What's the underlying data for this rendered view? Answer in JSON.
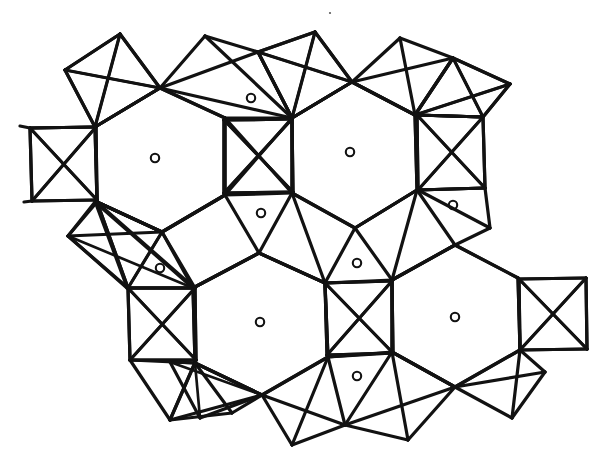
{
  "figure": {
    "background_color": "#ffffff",
    "line_color": "#121212",
    "marker_color": "#121212",
    "line_width": 3.2,
    "marker_radius": 4.2,
    "units": "pixels",
    "width": 608,
    "height": 473
  },
  "legend_items": [
    {
      "symbol": "open-circle",
      "label": "interstitial site",
      "count": 11
    },
    {
      "symbol": "solid-line",
      "label": "polyhedron edge",
      "count": 0
    }
  ],
  "hexagons": [
    {
      "name": "hexagon-upper-left",
      "center": [
        160,
        160
      ],
      "vertices": [
        [
          160,
          88
        ],
        [
          225,
          118
        ],
        [
          225,
          195
        ],
        [
          162,
          232
        ],
        [
          97,
          202
        ],
        [
          95,
          127
        ]
      ]
    },
    {
      "name": "hexagon-upper-right",
      "center": [
        352,
        154
      ],
      "vertices": [
        [
          352,
          82
        ],
        [
          415,
          115
        ],
        [
          417,
          190
        ],
        [
          355,
          228
        ],
        [
          292,
          193
        ],
        [
          292,
          118
        ]
      ]
    },
    {
      "name": "hexagon-lower-left",
      "center": [
        260,
        323
      ],
      "vertices": [
        [
          259,
          253
        ],
        [
          325,
          283
        ],
        [
          328,
          357
        ],
        [
          262,
          395
        ],
        [
          195,
          363
        ],
        [
          193,
          288
        ]
      ]
    },
    {
      "name": "hexagon-lower-right",
      "center": [
        455,
        317
      ],
      "vertices": [
        [
          455,
          245
        ],
        [
          518,
          278
        ],
        [
          520,
          350
        ],
        [
          455,
          387
        ],
        [
          392,
          352
        ],
        [
          392,
          280
        ]
      ]
    }
  ],
  "crossed_squares": [
    {
      "name": "crossed-square-far-left",
      "vertices": [
        [
          30,
          128
        ],
        [
          96,
          127
        ],
        [
          97,
          200
        ],
        [
          32,
          201
        ]
      ]
    },
    {
      "name": "crossed-square-center-top",
      "vertices": [
        [
          224,
          120
        ],
        [
          292,
          119
        ],
        [
          293,
          192
        ],
        [
          224,
          193
        ]
      ]
    },
    {
      "name": "crossed-square-right-top",
      "vertices": [
        [
          417,
          115
        ],
        [
          483,
          117
        ],
        [
          485,
          188
        ],
        [
          418,
          190
        ]
      ]
    },
    {
      "name": "crossed-square-left-bottom",
      "vertices": [
        [
          128,
          288
        ],
        [
          195,
          288
        ],
        [
          196,
          360
        ],
        [
          130,
          360
        ]
      ]
    },
    {
      "name": "crossed-square-center-bottom",
      "vertices": [
        [
          325,
          283
        ],
        [
          392,
          281
        ],
        [
          393,
          353
        ],
        [
          327,
          355
        ]
      ]
    },
    {
      "name": "crossed-square-far-right",
      "vertices": [
        [
          519,
          279
        ],
        [
          586,
          278
        ],
        [
          587,
          349
        ],
        [
          520,
          350
        ]
      ]
    }
  ],
  "crossed_quads_tilted": [
    {
      "name": "tilted-quad-top-left",
      "vertices": [
        [
          65,
          70
        ],
        [
          120,
          34
        ],
        [
          160,
          88
        ],
        [
          95,
          127
        ]
      ]
    },
    {
      "name": "tilted-quad-top-right",
      "vertices": [
        [
          258,
          52
        ],
        [
          315,
          32
        ],
        [
          352,
          82
        ],
        [
          292,
          118
        ]
      ]
    },
    {
      "name": "tilted-quad-upper-far-right",
      "vertices": [
        [
          415,
          115
        ],
        [
          453,
          58
        ],
        [
          510,
          84
        ],
        [
          483,
          117
        ]
      ]
    },
    {
      "name": "tilted-quad-left-mid",
      "vertices": [
        [
          95,
          202
        ],
        [
          68,
          236
        ],
        [
          127,
          288
        ],
        [
          193,
          288
        ]
      ]
    },
    {
      "name": "tilted-quad-bottom-left",
      "vertices": [
        [
          162,
          232
        ],
        [
          97,
          202
        ],
        [
          128,
          288
        ],
        [
          195,
          288
        ]
      ]
    },
    {
      "name": "tilted-quad-bottom-mid",
      "vertices": [
        [
          262,
          395
        ],
        [
          200,
          418
        ],
        [
          170,
          362
        ],
        [
          195,
          363
        ]
      ]
    }
  ],
  "site_markers": [
    {
      "name": "site-hex-upper-left",
      "position": [
        155,
        158
      ]
    },
    {
      "name": "site-triangle-top",
      "position": [
        251,
        98
      ]
    },
    {
      "name": "site-hex-upper-right",
      "position": [
        350,
        152
      ]
    },
    {
      "name": "site-triangle-right",
      "position": [
        453,
        205
      ]
    },
    {
      "name": "site-triangle-center",
      "position": [
        261,
        213
      ]
    },
    {
      "name": "site-triangle-left",
      "position": [
        160,
        268
      ]
    },
    {
      "name": "site-triangle-mid",
      "position": [
        357,
        263
      ]
    },
    {
      "name": "site-hex-lower-left",
      "position": [
        260,
        322
      ]
    },
    {
      "name": "site-hex-lower-right",
      "position": [
        455,
        317
      ]
    },
    {
      "name": "site-triangle-bottom",
      "position": [
        357,
        376
      ]
    },
    {
      "name": "site-speck-top",
      "position": [
        330,
        13
      ]
    }
  ],
  "edges": [
    [
      65,
      70,
      120,
      34
    ],
    [
      120,
      34,
      160,
      88
    ],
    [
      160,
      88,
      95,
      127
    ],
    [
      95,
      127,
      65,
      70
    ],
    [
      65,
      70,
      160,
      88
    ],
    [
      120,
      34,
      95,
      127
    ],
    [
      160,
      88,
      205,
      36
    ],
    [
      205,
      36,
      258,
      52
    ],
    [
      258,
      52,
      292,
      118
    ],
    [
      292,
      118,
      160,
      88
    ],
    [
      205,
      36,
      292,
      118
    ],
    [
      258,
      52,
      160,
      88
    ],
    [
      258,
      52,
      315,
      32
    ],
    [
      315,
      32,
      352,
      82
    ],
    [
      352,
      82,
      292,
      118
    ],
    [
      292,
      118,
      258,
      52
    ],
    [
      258,
      52,
      352,
      82
    ],
    [
      315,
      32,
      292,
      118
    ],
    [
      352,
      82,
      400,
      38
    ],
    [
      400,
      38,
      453,
      58
    ],
    [
      453,
      58,
      415,
      115
    ],
    [
      415,
      115,
      352,
      82
    ],
    [
      400,
      38,
      415,
      115
    ],
    [
      453,
      58,
      352,
      82
    ],
    [
      453,
      58,
      510,
      84
    ],
    [
      510,
      84,
      483,
      117
    ],
    [
      483,
      117,
      415,
      115
    ],
    [
      415,
      115,
      453,
      58
    ],
    [
      453,
      58,
      483,
      117
    ],
    [
      510,
      84,
      415,
      115
    ],
    [
      160,
      88,
      225,
      118
    ],
    [
      225,
      118,
      225,
      195
    ],
    [
      225,
      195,
      162,
      232
    ],
    [
      162,
      232,
      97,
      202
    ],
    [
      97,
      202,
      95,
      127
    ],
    [
      95,
      127,
      160,
      88
    ],
    [
      352,
      82,
      415,
      115
    ],
    [
      415,
      115,
      417,
      190
    ],
    [
      417,
      190,
      355,
      228
    ],
    [
      355,
      228,
      292,
      193
    ],
    [
      292,
      193,
      292,
      118
    ],
    [
      292,
      118,
      352,
      82
    ],
    [
      259,
      253,
      325,
      283
    ],
    [
      325,
      283,
      328,
      357
    ],
    [
      328,
      357,
      262,
      395
    ],
    [
      262,
      395,
      195,
      363
    ],
    [
      195,
      363,
      193,
      288
    ],
    [
      193,
      288,
      259,
      253
    ],
    [
      455,
      245,
      518,
      278
    ],
    [
      518,
      278,
      520,
      350
    ],
    [
      520,
      350,
      455,
      387
    ],
    [
      455,
      387,
      392,
      352
    ],
    [
      392,
      352,
      392,
      280
    ],
    [
      392,
      280,
      455,
      245
    ],
    [
      30,
      128,
      96,
      127
    ],
    [
      96,
      127,
      97,
      200
    ],
    [
      97,
      200,
      32,
      201
    ],
    [
      32,
      201,
      30,
      128
    ],
    [
      30,
      128,
      97,
      200
    ],
    [
      96,
      127,
      32,
      201
    ],
    [
      224,
      120,
      292,
      119
    ],
    [
      292,
      119,
      293,
      192
    ],
    [
      293,
      192,
      224,
      193
    ],
    [
      224,
      193,
      224,
      120
    ],
    [
      224,
      120,
      293,
      192
    ],
    [
      292,
      119,
      224,
      193
    ],
    [
      417,
      115,
      483,
      117
    ],
    [
      483,
      117,
      485,
      188
    ],
    [
      485,
      188,
      418,
      190
    ],
    [
      418,
      190,
      417,
      115
    ],
    [
      417,
      115,
      485,
      188
    ],
    [
      483,
      117,
      418,
      190
    ],
    [
      128,
      288,
      195,
      288
    ],
    [
      195,
      288,
      196,
      360
    ],
    [
      196,
      360,
      130,
      360
    ],
    [
      130,
      360,
      128,
      288
    ],
    [
      128,
      288,
      196,
      360
    ],
    [
      195,
      288,
      130,
      360
    ],
    [
      325,
      283,
      392,
      281
    ],
    [
      392,
      281,
      393,
      353
    ],
    [
      393,
      353,
      327,
      355
    ],
    [
      327,
      355,
      325,
      283
    ],
    [
      325,
      283,
      393,
      353
    ],
    [
      392,
      281,
      327,
      355
    ],
    [
      519,
      279,
      586,
      278
    ],
    [
      586,
      278,
      587,
      349
    ],
    [
      587,
      349,
      520,
      350
    ],
    [
      520,
      350,
      519,
      279
    ],
    [
      519,
      279,
      587,
      349
    ],
    [
      586,
      278,
      520,
      350
    ],
    [
      225,
      118,
      224,
      120
    ],
    [
      292,
      119,
      292,
      118
    ],
    [
      415,
      115,
      417,
      115
    ],
    [
      417,
      190,
      418,
      190
    ],
    [
      293,
      192,
      292,
      193
    ],
    [
      225,
      195,
      224,
      193
    ],
    [
      325,
      283,
      325,
      283
    ],
    [
      193,
      288,
      195,
      288
    ],
    [
      196,
      360,
      195,
      363
    ],
    [
      327,
      355,
      328,
      357
    ],
    [
      392,
      280,
      392,
      281
    ],
    [
      518,
      278,
      519,
      279
    ],
    [
      520,
      350,
      520,
      350
    ],
    [
      225,
      118,
      292,
      118
    ],
    [
      225,
      195,
      292,
      193
    ],
    [
      292,
      118,
      225,
      195
    ],
    [
      225,
      118,
      292,
      193
    ],
    [
      417,
      190,
      485,
      188
    ],
    [
      355,
      228,
      417,
      190
    ],
    [
      418,
      190,
      490,
      228
    ],
    [
      490,
      228,
      455,
      245
    ],
    [
      485,
      188,
      490,
      228
    ],
    [
      417,
      190,
      455,
      245
    ],
    [
      455,
      245,
      392,
      280
    ],
    [
      392,
      280,
      417,
      190
    ],
    [
      355,
      228,
      392,
      280
    ],
    [
      355,
      228,
      325,
      283
    ],
    [
      325,
      283,
      392,
      280
    ],
    [
      292,
      193,
      325,
      283
    ],
    [
      292,
      193,
      259,
      253
    ],
    [
      259,
      253,
      325,
      283
    ],
    [
      225,
      195,
      259,
      253
    ],
    [
      259,
      253,
      193,
      288
    ],
    [
      162,
      232,
      193,
      288
    ],
    [
      225,
      195,
      162,
      232
    ],
    [
      97,
      202,
      68,
      236
    ],
    [
      68,
      236,
      128,
      288
    ],
    [
      162,
      232,
      128,
      288
    ],
    [
      68,
      236,
      162,
      232
    ],
    [
      97,
      202,
      128,
      288
    ],
    [
      195,
      363,
      170,
      420
    ],
    [
      170,
      420,
      232,
      413
    ],
    [
      232,
      413,
      262,
      395
    ],
    [
      195,
      363,
      232,
      413
    ],
    [
      170,
      420,
      262,
      395
    ],
    [
      262,
      395,
      292,
      445
    ],
    [
      292,
      445,
      345,
      425
    ],
    [
      345,
      425,
      328,
      357
    ],
    [
      262,
      395,
      345,
      425
    ],
    [
      292,
      445,
      328,
      357
    ],
    [
      328,
      357,
      393,
      353
    ],
    [
      328,
      357,
      392,
      352
    ],
    [
      345,
      425,
      392,
      352
    ],
    [
      392,
      352,
      455,
      387
    ],
    [
      455,
      387,
      408,
      440
    ],
    [
      408,
      440,
      345,
      425
    ],
    [
      345,
      425,
      455,
      387
    ],
    [
      408,
      440,
      392,
      352
    ],
    [
      455,
      387,
      512,
      418
    ],
    [
      512,
      418,
      545,
      372
    ],
    [
      545,
      372,
      520,
      350
    ],
    [
      455,
      387,
      545,
      372
    ],
    [
      512,
      418,
      520,
      350
    ],
    [
      130,
      360,
      170,
      420
    ],
    [
      130,
      360,
      195,
      363
    ],
    [
      196,
      360,
      170,
      420
    ],
    [
      30,
      128,
      20,
      126
    ],
    [
      32,
      201,
      24,
      202
    ],
    [
      162,
      232,
      97,
      202
    ],
    [
      95,
      127,
      30,
      128
    ],
    [
      97,
      200,
      97,
      202
    ],
    [
      96,
      127,
      95,
      127
    ]
  ]
}
